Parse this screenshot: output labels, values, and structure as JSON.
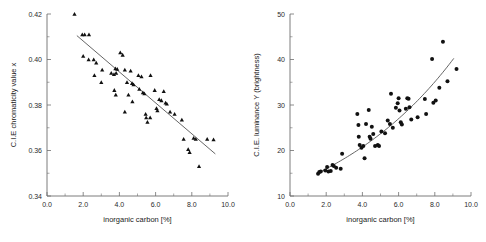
{
  "figure": {
    "name": "two-panel-scatter-figure",
    "background": "#ffffff",
    "marker_color": "#111111",
    "fit_color": "#555555",
    "axis_color": "#6e6e6e"
  },
  "chart_data": [
    {
      "id": "left",
      "type": "scatter",
      "title": "",
      "xlabel": "inorganic carbon [%]",
      "ylabel": "C.I.E chromaticity value x",
      "xlim": [
        0.0,
        10.0
      ],
      "ylim": [
        0.34,
        0.42
      ],
      "xticks": [
        0.0,
        2.0,
        4.0,
        6.0,
        8.0,
        10.0
      ],
      "xticklabels": [
        "0.0",
        "2.0",
        "4.0",
        "6.0",
        "8.0",
        "10.0"
      ],
      "yticks": [
        0.34,
        0.36,
        0.38,
        0.4,
        0.42
      ],
      "yticklabels": [
        "0.34",
        "0.36",
        "0.38",
        "0.40",
        "0.42"
      ],
      "xminor_count": 1,
      "yminor_count": 1,
      "grid": false,
      "legend": "none",
      "marker": "triangle",
      "marker_size": 2.1,
      "trend": {
        "kind": "linear",
        "x_start": 1.65,
        "x_end": 9.3,
        "y_start": 0.4105,
        "y_end": 0.3585
      },
      "points": [
        {
          "x": 1.52,
          "y": 0.42
        },
        {
          "x": 1.95,
          "y": 0.411
        },
        {
          "x": 2.08,
          "y": 0.411
        },
        {
          "x": 2.32,
          "y": 0.411
        },
        {
          "x": 2.0,
          "y": 0.4015
        },
        {
          "x": 2.3,
          "y": 0.4
        },
        {
          "x": 2.58,
          "y": 0.4
        },
        {
          "x": 2.72,
          "y": 0.3985
        },
        {
          "x": 2.62,
          "y": 0.393
        },
        {
          "x": 3.05,
          "y": 0.3955
        },
        {
          "x": 3.0,
          "y": 0.39
        },
        {
          "x": 3.55,
          "y": 0.394
        },
        {
          "x": 3.78,
          "y": 0.396
        },
        {
          "x": 3.88,
          "y": 0.3958
        },
        {
          "x": 3.7,
          "y": 0.3935
        },
        {
          "x": 3.82,
          "y": 0.394
        },
        {
          "x": 4.05,
          "y": 0.403
        },
        {
          "x": 4.18,
          "y": 0.402
        },
        {
          "x": 3.72,
          "y": 0.3865
        },
        {
          "x": 3.8,
          "y": 0.3845
        },
        {
          "x": 4.3,
          "y": 0.3955
        },
        {
          "x": 4.42,
          "y": 0.39
        },
        {
          "x": 4.5,
          "y": 0.3845
        },
        {
          "x": 4.3,
          "y": 0.377
        },
        {
          "x": 4.62,
          "y": 0.395
        },
        {
          "x": 4.7,
          "y": 0.3895
        },
        {
          "x": 4.78,
          "y": 0.389
        },
        {
          "x": 4.72,
          "y": 0.3815
        },
        {
          "x": 5.05,
          "y": 0.393
        },
        {
          "x": 5.1,
          "y": 0.387
        },
        {
          "x": 5.22,
          "y": 0.3925
        },
        {
          "x": 5.3,
          "y": 0.3855
        },
        {
          "x": 5.38,
          "y": 0.385
        },
        {
          "x": 5.45,
          "y": 0.376
        },
        {
          "x": 5.48,
          "y": 0.3745
        },
        {
          "x": 5.55,
          "y": 0.3725
        },
        {
          "x": 5.7,
          "y": 0.3745
        },
        {
          "x": 5.72,
          "y": 0.393
        },
        {
          "x": 5.95,
          "y": 0.3865
        },
        {
          "x": 6.05,
          "y": 0.3785
        },
        {
          "x": 6.1,
          "y": 0.3775
        },
        {
          "x": 6.2,
          "y": 0.3825
        },
        {
          "x": 6.32,
          "y": 0.382
        },
        {
          "x": 6.45,
          "y": 0.386
        },
        {
          "x": 6.55,
          "y": 0.381
        },
        {
          "x": 6.62,
          "y": 0.3805
        },
        {
          "x": 6.8,
          "y": 0.377
        },
        {
          "x": 7.05,
          "y": 0.376
        },
        {
          "x": 7.45,
          "y": 0.3735
        },
        {
          "x": 7.55,
          "y": 0.365
        },
        {
          "x": 7.8,
          "y": 0.3605
        },
        {
          "x": 7.88,
          "y": 0.3592
        },
        {
          "x": 8.1,
          "y": 0.3655
        },
        {
          "x": 8.22,
          "y": 0.365
        },
        {
          "x": 8.4,
          "y": 0.353
        },
        {
          "x": 8.85,
          "y": 0.365
        },
        {
          "x": 9.2,
          "y": 0.3648
        }
      ]
    },
    {
      "id": "right",
      "type": "scatter",
      "title": "",
      "xlabel": "inorganic carbon [%]",
      "ylabel": "C.I.E. luminance Y (brightness)",
      "xlim": [
        0.0,
        10.0
      ],
      "ylim": [
        10,
        50
      ],
      "xticks": [
        0.0,
        2.0,
        4.0,
        6.0,
        8.0,
        10.0
      ],
      "xticklabels": [
        "0.0",
        "2.0",
        "4.0",
        "6.0",
        "8.0",
        "10.0"
      ],
      "yticks": [
        10,
        20,
        30,
        40,
        50
      ],
      "yticklabels": [
        "10",
        "20",
        "30",
        "40",
        "50"
      ],
      "xminor_count": 1,
      "yminor_count": 1,
      "grid": false,
      "legend": "none",
      "marker": "circle",
      "marker_size": 2.0,
      "trend": {
        "kind": "exponential",
        "x_start": 1.55,
        "x_end": 9.05,
        "a": 12.3,
        "b": 0.131
      },
      "points": [
        {
          "x": 1.55,
          "y": 14.9
        },
        {
          "x": 1.62,
          "y": 15.3
        },
        {
          "x": 1.7,
          "y": 15.4
        },
        {
          "x": 1.95,
          "y": 15.6
        },
        {
          "x": 2.05,
          "y": 16.4
        },
        {
          "x": 2.12,
          "y": 15.4
        },
        {
          "x": 2.25,
          "y": 15.5
        },
        {
          "x": 2.35,
          "y": 16.8
        },
        {
          "x": 2.42,
          "y": 16.6
        },
        {
          "x": 2.55,
          "y": 16.2
        },
        {
          "x": 2.8,
          "y": 16.0
        },
        {
          "x": 2.88,
          "y": 19.3
        },
        {
          "x": 3.72,
          "y": 28.0
        },
        {
          "x": 3.78,
          "y": 25.6
        },
        {
          "x": 3.8,
          "y": 23.0
        },
        {
          "x": 3.85,
          "y": 21.2
        },
        {
          "x": 3.95,
          "y": 20.6
        },
        {
          "x": 4.05,
          "y": 21.0
        },
        {
          "x": 4.12,
          "y": 18.3
        },
        {
          "x": 4.2,
          "y": 25.8
        },
        {
          "x": 4.35,
          "y": 28.9
        },
        {
          "x": 4.4,
          "y": 23.0
        },
        {
          "x": 4.45,
          "y": 22.6
        },
        {
          "x": 4.52,
          "y": 25.2
        },
        {
          "x": 4.6,
          "y": 23.6
        },
        {
          "x": 4.7,
          "y": 21.0
        },
        {
          "x": 4.85,
          "y": 21.2
        },
        {
          "x": 4.92,
          "y": 21.0
        },
        {
          "x": 5.05,
          "y": 24.2
        },
        {
          "x": 5.25,
          "y": 23.8
        },
        {
          "x": 5.4,
          "y": 26.6
        },
        {
          "x": 5.52,
          "y": 25.8
        },
        {
          "x": 5.58,
          "y": 32.5
        },
        {
          "x": 5.68,
          "y": 25.0
        },
        {
          "x": 5.85,
          "y": 29.4
        },
        {
          "x": 5.95,
          "y": 30.4
        },
        {
          "x": 6.0,
          "y": 31.5
        },
        {
          "x": 6.05,
          "y": 28.8
        },
        {
          "x": 6.12,
          "y": 26.2
        },
        {
          "x": 6.18,
          "y": 25.7
        },
        {
          "x": 6.4,
          "y": 29.2
        },
        {
          "x": 6.48,
          "y": 31.5
        },
        {
          "x": 6.55,
          "y": 31.4
        },
        {
          "x": 6.6,
          "y": 29.5
        },
        {
          "x": 6.7,
          "y": 26.8
        },
        {
          "x": 7.05,
          "y": 27.3
        },
        {
          "x": 7.45,
          "y": 31.3
        },
        {
          "x": 7.52,
          "y": 28.0
        },
        {
          "x": 7.85,
          "y": 40.1
        },
        {
          "x": 7.92,
          "y": 30.5
        },
        {
          "x": 8.05,
          "y": 31.0
        },
        {
          "x": 8.25,
          "y": 33.8
        },
        {
          "x": 8.45,
          "y": 43.9
        },
        {
          "x": 8.7,
          "y": 35.2
        },
        {
          "x": 9.2,
          "y": 37.9
        }
      ]
    }
  ]
}
